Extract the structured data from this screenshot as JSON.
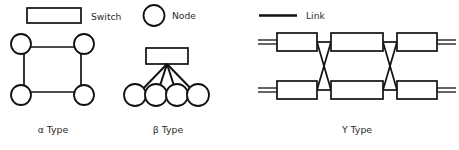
{
  "figure": {
    "background_color": "#ffffff",
    "stroke_color": "#111111",
    "text_color": "#2b2b2b",
    "legend": [
      {
        "key": "switch",
        "label": "Switch",
        "glyph": "rectangle-outline"
      },
      {
        "key": "node",
        "label": "Node",
        "glyph": "circle-outline"
      },
      {
        "key": "link",
        "label": "Link",
        "glyph": "thick-line"
      }
    ],
    "panels": [
      {
        "key": "alpha",
        "caption": "α Type",
        "topology": "ring",
        "node_count": 4,
        "switch_count": 0,
        "description": "Four nodes at the corners of a square connected in a ring"
      },
      {
        "key": "beta",
        "caption": "β Type",
        "topology": "star",
        "node_count": 4,
        "switch_count": 1,
        "description": "One central switch fanning out to four nodes"
      },
      {
        "key": "gamma",
        "caption": "Υ Type",
        "topology": "butterfly",
        "node_count": 0,
        "switch_count": 6,
        "switch_rows": 2,
        "switch_columns": 3,
        "crossings": 2,
        "description": "Two rows of three switches with crossed inter-stage links and external link stubs"
      }
    ]
  }
}
